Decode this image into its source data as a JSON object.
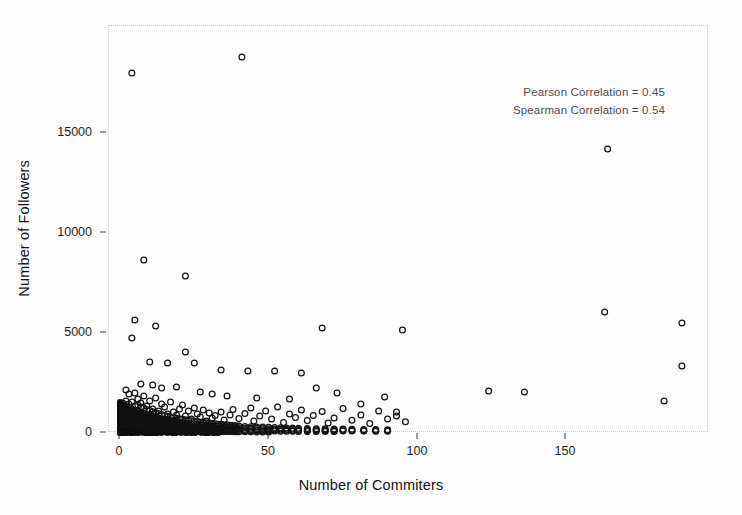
{
  "figure": {
    "background_color": "#fefefe",
    "frame_color": "#c9c9c9",
    "marker_color": "#121212"
  },
  "annotation": {
    "pearson": "Pearson Correlation = 0.45",
    "spearman": "Spearman Correlation = 0.54"
  },
  "axes": {
    "xlabel": "Number of Commiters",
    "ylabel": "Number of Followers",
    "xticks": [
      "0",
      "50",
      "100",
      "150"
    ],
    "yticks": [
      "0",
      "5000",
      "10000",
      "15000"
    ]
  },
  "chart_data": {
    "type": "scatter",
    "title": "",
    "xlabel": "Number of Commiters",
    "ylabel": "Number of Followers",
    "xlim": [
      -4,
      198
    ],
    "ylim": [
      -700,
      19900
    ],
    "xticks": [
      0,
      50,
      100,
      150
    ],
    "yticks": [
      0,
      5000,
      10000,
      15000
    ],
    "grid": false,
    "legend": null,
    "marker": "open-circle",
    "annotations": [
      "Pearson Correlation = 0.45",
      "Spearman Correlation = 0.54"
    ],
    "correlations": {
      "pearson": 0.45,
      "spearman": 0.54
    },
    "n_points_approx": 1150,
    "points": [
      [
        4,
        18000
      ],
      [
        41,
        18800
      ],
      [
        164,
        14200
      ],
      [
        8,
        8650
      ],
      [
        22,
        7850
      ],
      [
        5,
        5650
      ],
      [
        4,
        4750
      ],
      [
        12,
        5350
      ],
      [
        68,
        5250
      ],
      [
        95,
        5150
      ],
      [
        163,
        6050
      ],
      [
        189,
        5500
      ],
      [
        189,
        3350
      ],
      [
        10,
        3550
      ],
      [
        16,
        3500
      ],
      [
        22,
        4050
      ],
      [
        25,
        3500
      ],
      [
        34,
        3150
      ],
      [
        43,
        3100
      ],
      [
        52,
        3100
      ],
      [
        61,
        3000
      ],
      [
        7,
        2450
      ],
      [
        11,
        2400
      ],
      [
        14,
        2250
      ],
      [
        19,
        2300
      ],
      [
        27,
        2050
      ],
      [
        31,
        1950
      ],
      [
        36,
        1850
      ],
      [
        46,
        1750
      ],
      [
        57,
        1700
      ],
      [
        66,
        2250
      ],
      [
        73,
        2000
      ],
      [
        81,
        1450
      ],
      [
        89,
        1800
      ],
      [
        93,
        1050
      ],
      [
        124,
        2100
      ],
      [
        136,
        2050
      ],
      [
        183,
        1600
      ],
      [
        2,
        2150
      ],
      [
        3,
        1950
      ],
      [
        5,
        2000
      ],
      [
        6,
        1700
      ],
      [
        7,
        1500
      ],
      [
        8,
        1850
      ],
      [
        9,
        1350
      ],
      [
        10,
        1600
      ],
      [
        11,
        1200
      ],
      [
        12,
        1750
      ],
      [
        13,
        1100
      ],
      [
        14,
        1450
      ],
      [
        15,
        1300
      ],
      [
        16,
        950
      ],
      [
        17,
        1550
      ],
      [
        18,
        1050
      ],
      [
        19,
        900
      ],
      [
        20,
        1200
      ],
      [
        21,
        1400
      ],
      [
        22,
        850
      ],
      [
        23,
        1100
      ],
      [
        24,
        700
      ],
      [
        25,
        1250
      ],
      [
        26,
        950
      ],
      [
        27,
        800
      ],
      [
        28,
        1150
      ],
      [
        29,
        600
      ],
      [
        30,
        1000
      ],
      [
        31,
        750
      ],
      [
        32,
        880
      ],
      [
        34,
        1050
      ],
      [
        35,
        650
      ],
      [
        37,
        900
      ],
      [
        38,
        1180
      ],
      [
        40,
        720
      ],
      [
        42,
        980
      ],
      [
        44,
        1250
      ],
      [
        45,
        600
      ],
      [
        47,
        850
      ],
      [
        49,
        1100
      ],
      [
        51,
        700
      ],
      [
        53,
        1300
      ],
      [
        55,
        520
      ],
      [
        57,
        950
      ],
      [
        59,
        780
      ],
      [
        61,
        1150
      ],
      [
        63,
        620
      ],
      [
        65,
        880
      ],
      [
        68,
        1080
      ],
      [
        70,
        500
      ],
      [
        72,
        750
      ],
      [
        75,
        1220
      ],
      [
        78,
        640
      ],
      [
        81,
        900
      ],
      [
        84,
        480
      ],
      [
        87,
        1100
      ],
      [
        90,
        700
      ],
      [
        93,
        850
      ],
      [
        96,
        560
      ],
      [
        1,
        1500
      ],
      [
        1,
        1200
      ],
      [
        1,
        900
      ],
      [
        1,
        650
      ],
      [
        1,
        420
      ],
      [
        2,
        1600
      ],
      [
        2,
        1250
      ],
      [
        2,
        950
      ],
      [
        2,
        700
      ],
      [
        2,
        450
      ],
      [
        3,
        1450
      ],
      [
        3,
        1150
      ],
      [
        3,
        850
      ],
      [
        3,
        600
      ],
      [
        3,
        380
      ],
      [
        4,
        1550
      ],
      [
        4,
        1200
      ],
      [
        4,
        880
      ],
      [
        4,
        620
      ],
      [
        4,
        400
      ],
      [
        5,
        1350
      ],
      [
        5,
        1050
      ],
      [
        5,
        780
      ],
      [
        5,
        540
      ],
      [
        5,
        330
      ],
      [
        6,
        1400
      ],
      [
        6,
        1100
      ],
      [
        6,
        820
      ],
      [
        6,
        580
      ],
      [
        6,
        360
      ],
      [
        7,
        1300
      ],
      [
        7,
        1000
      ],
      [
        7,
        740
      ],
      [
        7,
        510
      ],
      [
        7,
        310
      ],
      [
        8,
        1250
      ],
      [
        8,
        960
      ],
      [
        8,
        700
      ],
      [
        8,
        480
      ],
      [
        8,
        290
      ],
      [
        9,
        1180
      ],
      [
        9,
        900
      ],
      [
        9,
        660
      ],
      [
        9,
        450
      ],
      [
        9,
        270
      ],
      [
        10,
        1120
      ],
      [
        10,
        860
      ],
      [
        10,
        630
      ],
      [
        10,
        430
      ],
      [
        10,
        255
      ],
      [
        11,
        1060
      ],
      [
        11,
        820
      ],
      [
        11,
        600
      ],
      [
        11,
        410
      ],
      [
        11,
        240
      ],
      [
        12,
        1000
      ],
      [
        12,
        780
      ],
      [
        12,
        570
      ],
      [
        12,
        390
      ],
      [
        12,
        225
      ],
      [
        13,
        960
      ],
      [
        13,
        740
      ],
      [
        13,
        540
      ],
      [
        13,
        370
      ],
      [
        13,
        210
      ],
      [
        14,
        920
      ],
      [
        14,
        710
      ],
      [
        14,
        515
      ],
      [
        14,
        350
      ],
      [
        14,
        200
      ],
      [
        15,
        880
      ],
      [
        15,
        680
      ],
      [
        15,
        490
      ],
      [
        15,
        335
      ],
      [
        15,
        190
      ],
      [
        16,
        840
      ],
      [
        16,
        650
      ],
      [
        16,
        470
      ],
      [
        16,
        320
      ],
      [
        16,
        180
      ],
      [
        17,
        800
      ],
      [
        17,
        620
      ],
      [
        17,
        450
      ],
      [
        17,
        305
      ],
      [
        17,
        170
      ],
      [
        18,
        770
      ],
      [
        18,
        595
      ],
      [
        18,
        430
      ],
      [
        18,
        290
      ],
      [
        18,
        162
      ],
      [
        19,
        740
      ],
      [
        19,
        570
      ],
      [
        19,
        412
      ],
      [
        19,
        278
      ],
      [
        19,
        155
      ],
      [
        20,
        710
      ],
      [
        20,
        545
      ],
      [
        20,
        395
      ],
      [
        20,
        266
      ],
      [
        20,
        148
      ],
      [
        21,
        685
      ],
      [
        21,
        525
      ],
      [
        21,
        380
      ],
      [
        21,
        255
      ],
      [
        21,
        141
      ],
      [
        22,
        660
      ],
      [
        22,
        505
      ],
      [
        22,
        365
      ],
      [
        22,
        245
      ],
      [
        22,
        135
      ],
      [
        23,
        635
      ],
      [
        23,
        485
      ],
      [
        23,
        350
      ],
      [
        23,
        235
      ],
      [
        23,
        129
      ],
      [
        24,
        612
      ],
      [
        24,
        467
      ],
      [
        24,
        337
      ],
      [
        24,
        226
      ],
      [
        24,
        124
      ],
      [
        25,
        590
      ],
      [
        25,
        450
      ],
      [
        25,
        324
      ],
      [
        25,
        217
      ],
      [
        25,
        119
      ],
      [
        26,
        568
      ],
      [
        26,
        433
      ],
      [
        26,
        312
      ],
      [
        26,
        209
      ],
      [
        26,
        114
      ],
      [
        27,
        548
      ],
      [
        27,
        417
      ],
      [
        27,
        300
      ],
      [
        27,
        201
      ],
      [
        27,
        109
      ],
      [
        28,
        528
      ],
      [
        28,
        402
      ],
      [
        28,
        289
      ],
      [
        28,
        193
      ],
      [
        28,
        105
      ],
      [
        29,
        509
      ],
      [
        29,
        387
      ],
      [
        29,
        278
      ],
      [
        29,
        186
      ],
      [
        29,
        101
      ],
      [
        30,
        491
      ],
      [
        30,
        373
      ],
      [
        30,
        268
      ],
      [
        30,
        179
      ],
      [
        30,
        97
      ],
      [
        31,
        474
      ],
      [
        31,
        360
      ],
      [
        31,
        258
      ],
      [
        31,
        172
      ],
      [
        31,
        93
      ],
      [
        32,
        457
      ],
      [
        32,
        347
      ],
      [
        32,
        249
      ],
      [
        32,
        166
      ],
      [
        32,
        89
      ],
      [
        33,
        441
      ],
      [
        33,
        335
      ],
      [
        33,
        240
      ],
      [
        33,
        160
      ],
      [
        33,
        86
      ],
      [
        34,
        425
      ],
      [
        34,
        323
      ],
      [
        34,
        231
      ],
      [
        34,
        154
      ],
      [
        34,
        82
      ],
      [
        35,
        410
      ],
      [
        35,
        311
      ],
      [
        35,
        223
      ],
      [
        35,
        148
      ],
      [
        35,
        79
      ],
      [
        36,
        396
      ],
      [
        36,
        300
      ],
      [
        36,
        215
      ],
      [
        36,
        143
      ],
      [
        36,
        76
      ],
      [
        37,
        382
      ],
      [
        37,
        290
      ],
      [
        37,
        207
      ],
      [
        37,
        138
      ],
      [
        37,
        73
      ],
      [
        38,
        369
      ],
      [
        38,
        280
      ],
      [
        38,
        200
      ],
      [
        38,
        133
      ],
      [
        38,
        70
      ],
      [
        39,
        356
      ],
      [
        39,
        270
      ],
      [
        39,
        193
      ],
      [
        39,
        128
      ],
      [
        39,
        67
      ],
      [
        40,
        344
      ],
      [
        40,
        261
      ],
      [
        40,
        186
      ],
      [
        40,
        124
      ],
      [
        40,
        65
      ],
      [
        42,
        330
      ],
      [
        42,
        250
      ],
      [
        42,
        178
      ],
      [
        42,
        118
      ],
      [
        42,
        61
      ],
      [
        44,
        317
      ],
      [
        44,
        240
      ],
      [
        44,
        171
      ],
      [
        44,
        113
      ],
      [
        44,
        58
      ],
      [
        46,
        305
      ],
      [
        46,
        231
      ],
      [
        46,
        164
      ],
      [
        46,
        108
      ],
      [
        46,
        55
      ],
      [
        48,
        293
      ],
      [
        48,
        222
      ],
      [
        48,
        158
      ],
      [
        48,
        104
      ],
      [
        48,
        52
      ],
      [
        50,
        282
      ],
      [
        50,
        213
      ],
      [
        50,
        152
      ],
      [
        50,
        100
      ],
      [
        50,
        50
      ],
      [
        52,
        272
      ],
      [
        52,
        205
      ],
      [
        52,
        146
      ],
      [
        52,
        96
      ],
      [
        54,
        262
      ],
      [
        54,
        198
      ],
      [
        54,
        140
      ],
      [
        54,
        92
      ],
      [
        56,
        252
      ],
      [
        56,
        190
      ],
      [
        56,
        135
      ],
      [
        56,
        88
      ],
      [
        58,
        243
      ],
      [
        58,
        183
      ],
      [
        58,
        130
      ],
      [
        58,
        85
      ],
      [
        60,
        234
      ],
      [
        60,
        177
      ],
      [
        60,
        125
      ],
      [
        60,
        81
      ],
      [
        63,
        225
      ],
      [
        63,
        170
      ],
      [
        63,
        120
      ],
      [
        63,
        78
      ],
      [
        66,
        217
      ],
      [
        66,
        164
      ],
      [
        66,
        116
      ],
      [
        66,
        75
      ],
      [
        69,
        209
      ],
      [
        69,
        158
      ],
      [
        69,
        111
      ],
      [
        69,
        72
      ],
      [
        72,
        201
      ],
      [
        72,
        152
      ],
      [
        72,
        107
      ],
      [
        72,
        69
      ],
      [
        75,
        194
      ],
      [
        75,
        146
      ],
      [
        75,
        103
      ],
      [
        78,
        187
      ],
      [
        78,
        141
      ],
      [
        78,
        99
      ],
      [
        82,
        180
      ],
      [
        82,
        136
      ],
      [
        82,
        95
      ],
      [
        86,
        173
      ],
      [
        86,
        131
      ],
      [
        86,
        92
      ],
      [
        90,
        167
      ],
      [
        90,
        126
      ],
      [
        90,
        88
      ]
    ]
  }
}
